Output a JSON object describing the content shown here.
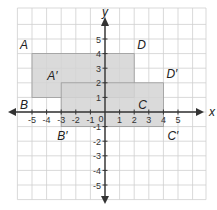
{
  "diagram": {
    "type": "coordinate-grid-translation",
    "axes": {
      "x_label": "x",
      "y_label": "y",
      "x_ticks": [
        "-5",
        "-4",
        "-3",
        "-2",
        "-1",
        "1",
        "2",
        "3",
        "4",
        "5"
      ],
      "y_ticks": [
        "5",
        "4",
        "3",
        "2",
        "1",
        "-1",
        "-2",
        "-3",
        "-4",
        "-5"
      ],
      "origin_label": "0"
    },
    "rectangles": [
      {
        "name": "ABCD",
        "vertices": {
          "A": [
            -5,
            4
          ],
          "D": [
            2,
            4
          ],
          "C": [
            2,
            1
          ],
          "B": [
            -5,
            1
          ]
        },
        "labels": {
          "A": "A",
          "B": "B",
          "C": "C",
          "D": "D"
        }
      },
      {
        "name": "A'B'C'D'",
        "vertices": {
          "A'": [
            -3,
            2
          ],
          "D'": [
            4,
            2
          ],
          "C'": [
            4,
            -1
          ],
          "B'": [
            -3,
            -1
          ]
        },
        "labels": {
          "A": "A′",
          "B": "B′",
          "C": "C′",
          "D": "D′"
        }
      }
    ],
    "colors": {
      "fill": "#d3d3d3",
      "rect_stroke": "#9a9a9a",
      "grid": "#cfcfcf",
      "axis": "#333333"
    }
  }
}
